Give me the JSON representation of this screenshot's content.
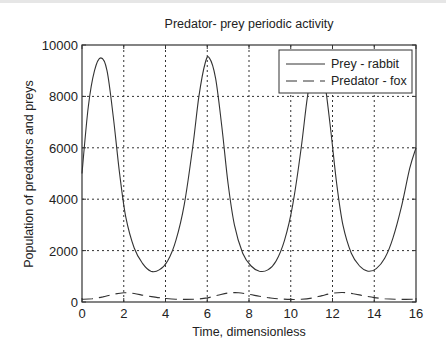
{
  "chart_data": {
    "type": "line",
    "title": "Predator- prey periodic activity",
    "xlabel": "Time, dimensionless",
    "ylabel": "Population of predators and preys",
    "xlim": [
      0,
      16
    ],
    "ylim": [
      0,
      10000
    ],
    "xticks": [
      0,
      2,
      4,
      6,
      8,
      10,
      12,
      14,
      16
    ],
    "yticks": [
      0,
      2000,
      4000,
      6000,
      8000,
      10000
    ],
    "grid": true,
    "legend_position": "upper right",
    "series": [
      {
        "name": "Prey - rabbit",
        "style": "solid",
        "x": [
          0,
          0.3,
          0.6,
          0.9,
          1.2,
          1.5,
          1.8,
          2.1,
          2.5,
          2.9,
          3.3,
          3.7,
          4.1,
          4.5,
          4.9,
          5.3,
          5.6,
          5.9,
          6.1,
          6.4,
          6.7,
          7.0,
          7.3,
          7.7,
          8.1,
          8.5,
          8.9,
          9.3,
          9.7,
          10.1,
          10.5,
          10.8,
          11.1,
          11.3,
          11.6,
          11.9,
          12.2,
          12.5,
          12.9,
          13.3,
          13.7,
          14.1,
          14.5,
          14.9,
          15.3,
          15.7,
          16.0
        ],
        "values": [
          5000,
          7600,
          9000,
          9500,
          9000,
          7200,
          5000,
          3300,
          2100,
          1500,
          1200,
          1250,
          1600,
          2400,
          3800,
          6000,
          8000,
          9300,
          9500,
          8700,
          6800,
          4600,
          3000,
          1900,
          1400,
          1200,
          1250,
          1600,
          2400,
          3800,
          6000,
          8000,
          9300,
          9500,
          8700,
          6800,
          4600,
          3000,
          1900,
          1400,
          1200,
          1300,
          1700,
          2500,
          3700,
          5200,
          6000
        ]
      },
      {
        "name": "Predator - fox",
        "style": "dashed",
        "x": [
          0,
          0.5,
          1.0,
          1.5,
          2.0,
          2.5,
          3.0,
          3.5,
          4.0,
          4.5,
          5.0,
          5.5,
          6.0,
          6.5,
          7.0,
          7.5,
          8.0,
          8.5,
          9.0,
          9.5,
          10.0,
          10.5,
          11.0,
          11.5,
          12.0,
          12.5,
          13.0,
          13.5,
          14.0,
          14.5,
          15.0,
          15.5,
          16.0
        ],
        "values": [
          100,
          130,
          200,
          300,
          360,
          330,
          250,
          190,
          140,
          110,
          100,
          110,
          160,
          260,
          350,
          360,
          300,
          220,
          160,
          120,
          100,
          110,
          150,
          250,
          340,
          370,
          320,
          240,
          170,
          130,
          110,
          100,
          110
        ]
      }
    ]
  },
  "title": "Predator- prey periodic activity",
  "axes": {
    "xlabel": "Time, dimensionless",
    "ylabel": "Population of predators and preys",
    "xtick_labels": [
      "0",
      "2",
      "4",
      "6",
      "8",
      "10",
      "12",
      "14",
      "16"
    ],
    "ytick_labels": [
      "0",
      "2000",
      "4000",
      "6000",
      "8000",
      "10000"
    ]
  },
  "legend": {
    "items": [
      {
        "label": "Prey - rabbit",
        "style": "solid"
      },
      {
        "label": "Predator - fox",
        "style": "dashed"
      }
    ]
  },
  "colors": {
    "line": "#333333",
    "grid": "#333333",
    "axis": "#333333",
    "background": "#ffffff"
  }
}
